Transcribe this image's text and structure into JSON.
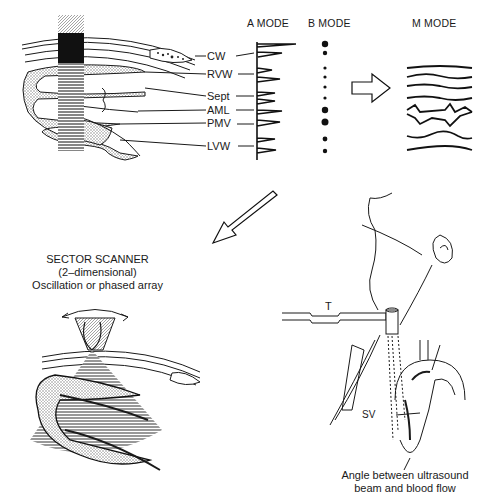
{
  "headings": {
    "a_mode": "A MODE",
    "b_mode": "B MODE",
    "m_mode": "M MODE"
  },
  "structure_labels": [
    "CW",
    "RVW",
    "Sept",
    "AML",
    "PMV",
    "LVW"
  ],
  "sector_scanner": {
    "line1": "SECTOR SCANNER",
    "line2": "(2–dimensional)",
    "line3": "Oscillation or phased array"
  },
  "doppler": {
    "transducer_label": "T",
    "sample_volume_label": "SV",
    "caption_line1": "Angle between ultrasound",
    "caption_line2": "beam and blood flow"
  },
  "colors": {
    "ink": "#1a1a1a",
    "background": "#ffffff",
    "stipple": "#9a9a9a"
  }
}
